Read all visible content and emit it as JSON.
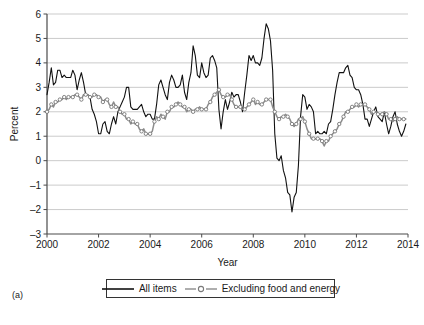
{
  "figure": {
    "panel_label": "(a)"
  },
  "legend": {
    "position": "bottom-center",
    "entries": [
      {
        "label": "All items",
        "style": "solid-line",
        "color": "#111111"
      },
      {
        "label": "Excluding food and energy",
        "style": "line-with-circle-markers",
        "color": "#8c8c8c"
      }
    ]
  },
  "chart_data": {
    "type": "line",
    "title": "",
    "xlabel": "Year",
    "ylabel": "Percent",
    "xlim": [
      2000,
      2014
    ],
    "ylim": [
      -3,
      6
    ],
    "xticks": [
      2000,
      2002,
      2004,
      2006,
      2008,
      2010,
      2012,
      2014
    ],
    "yticks": [
      -3,
      -2,
      -1,
      0,
      1,
      2,
      3,
      4,
      5,
      6
    ],
    "grid": "horizontal",
    "legend_position": "bottom-center",
    "series": [
      {
        "name": "All items",
        "color": "#111111",
        "marker": "none",
        "x": [
          2000.0,
          2000.083,
          2000.167,
          2000.25,
          2000.333,
          2000.417,
          2000.5,
          2000.583,
          2000.667,
          2000.75,
          2000.833,
          2000.917,
          2001.0,
          2001.083,
          2001.167,
          2001.25,
          2001.333,
          2001.417,
          2001.5,
          2001.583,
          2001.667,
          2001.75,
          2001.833,
          2001.917,
          2002.0,
          2002.083,
          2002.167,
          2002.25,
          2002.333,
          2002.417,
          2002.5,
          2002.583,
          2002.667,
          2002.75,
          2002.833,
          2002.917,
          2003.0,
          2003.083,
          2003.167,
          2003.25,
          2003.333,
          2003.417,
          2003.5,
          2003.583,
          2003.667,
          2003.75,
          2003.833,
          2003.917,
          2004.0,
          2004.083,
          2004.167,
          2004.25,
          2004.333,
          2004.417,
          2004.5,
          2004.583,
          2004.667,
          2004.75,
          2004.833,
          2004.917,
          2005.0,
          2005.083,
          2005.167,
          2005.25,
          2005.333,
          2005.417,
          2005.5,
          2005.583,
          2005.667,
          2005.75,
          2005.833,
          2005.917,
          2006.0,
          2006.083,
          2006.167,
          2006.25,
          2006.333,
          2006.417,
          2006.5,
          2006.583,
          2006.667,
          2006.75,
          2006.833,
          2006.917,
          2007.0,
          2007.083,
          2007.167,
          2007.25,
          2007.333,
          2007.417,
          2007.5,
          2007.583,
          2007.667,
          2007.75,
          2007.833,
          2007.917,
          2008.0,
          2008.083,
          2008.167,
          2008.25,
          2008.333,
          2008.417,
          2008.5,
          2008.583,
          2008.667,
          2008.75,
          2008.833,
          2008.917,
          2009.0,
          2009.083,
          2009.167,
          2009.25,
          2009.333,
          2009.417,
          2009.5,
          2009.583,
          2009.667,
          2009.75,
          2009.833,
          2009.917,
          2010.0,
          2010.083,
          2010.167,
          2010.25,
          2010.333,
          2010.417,
          2010.5,
          2010.583,
          2010.667,
          2010.75,
          2010.833,
          2010.917,
          2011.0,
          2011.083,
          2011.167,
          2011.25,
          2011.333,
          2011.417,
          2011.5,
          2011.583,
          2011.667,
          2011.75,
          2011.833,
          2011.917,
          2012.0,
          2012.083,
          2012.167,
          2012.25,
          2012.333,
          2012.417,
          2012.5,
          2012.583,
          2012.667,
          2012.75,
          2012.833,
          2012.917,
          2013.0,
          2013.083,
          2013.167,
          2013.25,
          2013.333,
          2013.417,
          2013.5,
          2013.583,
          2013.667,
          2013.75,
          2013.833,
          2013.917
        ],
        "values": [
          2.7,
          3.2,
          3.8,
          3.1,
          3.2,
          3.7,
          3.7,
          3.4,
          3.5,
          3.4,
          3.4,
          3.4,
          3.7,
          3.5,
          2.9,
          3.3,
          3.6,
          3.2,
          2.7,
          2.7,
          2.6,
          2.1,
          1.9,
          1.6,
          1.1,
          1.1,
          1.5,
          1.6,
          1.2,
          1.1,
          1.5,
          1.8,
          1.5,
          2.0,
          2.2,
          2.4,
          2.6,
          3.0,
          3.0,
          2.2,
          2.1,
          2.1,
          2.1,
          2.2,
          2.3,
          2.0,
          1.8,
          1.9,
          1.9,
          1.7,
          1.7,
          2.3,
          3.1,
          3.3,
          3.0,
          2.7,
          2.5,
          3.2,
          3.5,
          3.3,
          3.0,
          3.0,
          3.1,
          3.5,
          2.8,
          2.5,
          3.2,
          3.6,
          4.7,
          4.3,
          3.5,
          3.4,
          4.0,
          3.6,
          3.4,
          3.5,
          4.2,
          4.3,
          4.1,
          3.8,
          2.1,
          1.3,
          2.0,
          2.5,
          2.1,
          2.4,
          2.8,
          2.6,
          2.7,
          2.7,
          2.4,
          2.0,
          2.8,
          3.5,
          4.3,
          4.1,
          4.3,
          4.0,
          4.0,
          3.9,
          4.2,
          5.0,
          5.6,
          5.4,
          4.9,
          3.7,
          1.1,
          0.1,
          0.0,
          0.2,
          -0.4,
          -0.7,
          -1.3,
          -1.4,
          -2.1,
          -1.5,
          -1.3,
          -0.2,
          1.8,
          2.7,
          2.6,
          2.1,
          2.3,
          2.2,
          2.0,
          1.1,
          1.2,
          1.1,
          1.1,
          1.2,
          1.1,
          1.5,
          1.6,
          2.1,
          2.7,
          3.2,
          3.6,
          3.6,
          3.6,
          3.8,
          3.9,
          3.5,
          3.4,
          3.0,
          2.9,
          2.9,
          2.7,
          2.3,
          1.7,
          1.7,
          1.4,
          1.7,
          2.0,
          2.2,
          1.8,
          1.7,
          1.6,
          2.0,
          1.5,
          1.1,
          1.4,
          1.8,
          2.0,
          1.5,
          1.2,
          1.0,
          1.2,
          1.5
        ]
      },
      {
        "name": "Excluding food and energy",
        "color": "#8c8c8c",
        "marker": "circle",
        "x": [
          2000.0,
          2000.083,
          2000.167,
          2000.25,
          2000.333,
          2000.417,
          2000.5,
          2000.583,
          2000.667,
          2000.75,
          2000.833,
          2000.917,
          2001.0,
          2001.083,
          2001.167,
          2001.25,
          2001.333,
          2001.417,
          2001.5,
          2001.583,
          2001.667,
          2001.75,
          2001.833,
          2001.917,
          2002.0,
          2002.083,
          2002.167,
          2002.25,
          2002.333,
          2002.417,
          2002.5,
          2002.583,
          2002.667,
          2002.75,
          2002.833,
          2002.917,
          2003.0,
          2003.083,
          2003.167,
          2003.25,
          2003.333,
          2003.417,
          2003.5,
          2003.583,
          2003.667,
          2003.75,
          2003.833,
          2003.917,
          2004.0,
          2004.083,
          2004.167,
          2004.25,
          2004.333,
          2004.417,
          2004.5,
          2004.583,
          2004.667,
          2004.75,
          2004.833,
          2004.917,
          2005.0,
          2005.083,
          2005.167,
          2005.25,
          2005.333,
          2005.417,
          2005.5,
          2005.583,
          2005.667,
          2005.75,
          2005.833,
          2005.917,
          2006.0,
          2006.083,
          2006.167,
          2006.25,
          2006.333,
          2006.417,
          2006.5,
          2006.583,
          2006.667,
          2006.75,
          2006.833,
          2006.917,
          2007.0,
          2007.083,
          2007.167,
          2007.25,
          2007.333,
          2007.417,
          2007.5,
          2007.583,
          2007.667,
          2007.75,
          2007.833,
          2007.917,
          2008.0,
          2008.083,
          2008.167,
          2008.25,
          2008.333,
          2008.417,
          2008.5,
          2008.583,
          2008.667,
          2008.75,
          2008.833,
          2008.917,
          2009.0,
          2009.083,
          2009.167,
          2009.25,
          2009.333,
          2009.417,
          2009.5,
          2009.583,
          2009.667,
          2009.75,
          2009.833,
          2009.917,
          2010.0,
          2010.083,
          2010.167,
          2010.25,
          2010.333,
          2010.417,
          2010.5,
          2010.583,
          2010.667,
          2010.75,
          2010.833,
          2010.917,
          2011.0,
          2011.083,
          2011.167,
          2011.25,
          2011.333,
          2011.417,
          2011.5,
          2011.583,
          2011.667,
          2011.75,
          2011.833,
          2011.917,
          2012.0,
          2012.083,
          2012.167,
          2012.25,
          2012.333,
          2012.417,
          2012.5,
          2012.583,
          2012.667,
          2012.75,
          2012.833,
          2012.917,
          2013.0,
          2013.083,
          2013.167,
          2013.25,
          2013.333,
          2013.417,
          2013.5,
          2013.583,
          2013.667,
          2013.75,
          2013.833,
          2013.917
        ],
        "values": [
          2.0,
          2.1,
          2.3,
          2.2,
          2.4,
          2.4,
          2.5,
          2.5,
          2.6,
          2.5,
          2.6,
          2.6,
          2.6,
          2.7,
          2.7,
          2.6,
          2.5,
          2.7,
          2.7,
          2.7,
          2.6,
          2.6,
          2.7,
          2.7,
          2.6,
          2.6,
          2.4,
          2.5,
          2.5,
          2.3,
          2.2,
          2.4,
          2.2,
          2.2,
          2.0,
          1.9,
          1.9,
          1.7,
          1.7,
          1.5,
          1.6,
          1.5,
          1.5,
          1.3,
          1.2,
          1.3,
          1.1,
          1.1,
          1.1,
          1.2,
          1.6,
          1.8,
          1.7,
          1.9,
          1.8,
          1.7,
          2.0,
          2.0,
          2.2,
          2.2,
          2.3,
          2.4,
          2.3,
          2.2,
          2.2,
          2.0,
          2.1,
          2.1,
          2.0,
          2.1,
          2.1,
          2.2,
          2.1,
          2.1,
          2.1,
          2.3,
          2.4,
          2.6,
          2.7,
          2.8,
          2.9,
          2.7,
          2.6,
          2.6,
          2.7,
          2.7,
          2.5,
          2.3,
          2.2,
          2.2,
          2.2,
          2.1,
          2.1,
          2.2,
          2.3,
          2.4,
          2.5,
          2.3,
          2.4,
          2.3,
          2.3,
          2.4,
          2.5,
          2.5,
          2.5,
          2.2,
          2.0,
          1.8,
          1.7,
          1.8,
          1.8,
          1.9,
          1.8,
          1.7,
          1.5,
          1.4,
          1.5,
          1.7,
          1.7,
          1.8,
          1.6,
          1.3,
          1.1,
          0.9,
          0.9,
          0.9,
          0.9,
          0.9,
          0.8,
          0.6,
          0.8,
          0.8,
          1.0,
          1.1,
          1.2,
          1.3,
          1.5,
          1.6,
          1.8,
          2.0,
          2.0,
          2.1,
          2.2,
          2.2,
          2.3,
          2.2,
          2.3,
          2.3,
          2.3,
          2.2,
          2.1,
          1.9,
          2.0,
          2.0,
          1.9,
          1.9,
          1.9,
          2.0,
          1.9,
          1.7,
          1.7,
          1.6,
          1.7,
          1.8,
          1.7,
          1.7,
          1.7,
          1.7
        ]
      }
    ]
  }
}
